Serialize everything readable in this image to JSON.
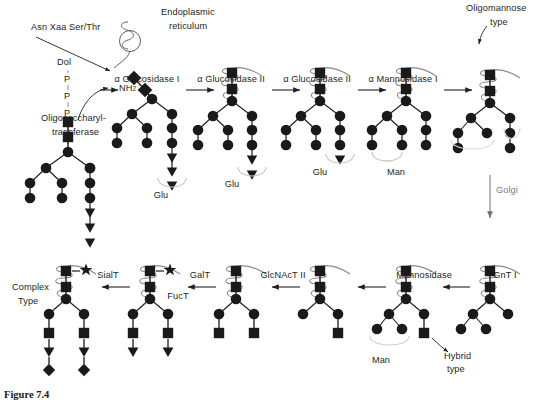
{
  "figure": {
    "caption": "Figure 7.4"
  },
  "labels": {
    "sequon": "Asn Xaa Ser/Thr",
    "er": "Endoplasmic",
    "er2": "reticulum",
    "dol": "Dol",
    "p1": "P",
    "p2": "P",
    "p3": "P",
    "ost1": "Oligosaccharyl-",
    "ost2": "transferase",
    "nh2": "NH",
    "nh2sub": "2",
    "oligomannose1": "Oligomannose",
    "oligomannose2": "type",
    "golgi": "Golgi",
    "complex1": "Complex",
    "complex2": "Type",
    "hybrid1": "Hybrid",
    "hybrid2": "type"
  },
  "enzymes": {
    "top": [
      {
        "name": "α Glucosidase I",
        "x": 147,
        "y": 74
      },
      {
        "name": "α Glucosidase II",
        "x": 231,
        "y": 74
      },
      {
        "name": "α Glucosidase II",
        "x": 317,
        "y": 74
      },
      {
        "name": "α Mannosidase I",
        "x": 403,
        "y": 74
      }
    ],
    "bottom": [
      {
        "name": "GnT I",
        "x": 505,
        "y": 270
      },
      {
        "name": "Mannosidase",
        "x": 424,
        "y": 270
      },
      {
        "name": "GlcNAcT II",
        "x": 283,
        "y": 270
      },
      {
        "name": "GalT",
        "x": 200,
        "y": 270
      },
      {
        "name": "FucT",
        "x": 178,
        "y": 291
      },
      {
        "name": "SialT",
        "x": 108,
        "y": 270
      }
    ]
  },
  "released_sugars": [
    {
      "text": "Glu",
      "x": 161,
      "y": 190
    },
    {
      "text": "Glu",
      "x": 232,
      "y": 179
    },
    {
      "text": "Glu",
      "x": 320,
      "y": 167
    },
    {
      "text": "Man",
      "x": 396,
      "y": 167
    },
    {
      "text": "Man",
      "x": 381,
      "y": 355
    }
  ],
  "legend_symbols": [
    {
      "shape": "circle",
      "meaning": "mannose"
    },
    {
      "shape": "square",
      "meaning": "N-acetylglucosamine"
    },
    {
      "shape": "triangle",
      "meaning": "glucose / galactose"
    },
    {
      "shape": "diamond",
      "meaning": "sialic acid"
    },
    {
      "shape": "star",
      "meaning": "fucose"
    }
  ],
  "icons": {
    "arrow": "arrow-right-icon",
    "protein": "protein-squiggle-icon",
    "membrane": "er-membrane-icon"
  }
}
